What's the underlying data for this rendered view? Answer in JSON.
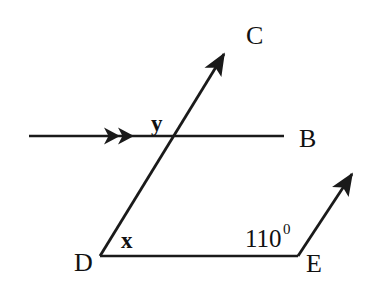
{
  "figure": {
    "type": "geometry-diagram",
    "background_color": "#ffffff",
    "stroke_color": "#1a1a1a",
    "labels": {
      "point_b": "B",
      "point_c": "C",
      "point_d": "D",
      "point_e": "E",
      "angle_x": "x",
      "angle_y": "y",
      "angle_value": "110",
      "angle_value_superscript": "0"
    },
    "elements": [
      {
        "name": "horizontal-line-to-b",
        "kind": "line",
        "from": [
          29,
          136
        ],
        "to": [
          284,
          136
        ],
        "marker": "double-chevron",
        "marker_at": [
          118,
          136
        ],
        "endpoint_label": "B"
      },
      {
        "name": "transversal-ray-d-to-c",
        "kind": "ray",
        "from": [
          100,
          256
        ],
        "to": [
          228,
          48
        ],
        "arrowhead": "end",
        "endpoint_label": "C",
        "passes_through": [
          170,
          136
        ]
      },
      {
        "name": "baseline-d-to-e",
        "kind": "line",
        "from": [
          100,
          256
        ],
        "to": [
          298,
          256
        ],
        "endpoint_label_start": "D",
        "endpoint_label_end": "E"
      },
      {
        "name": "ray-e-upward",
        "kind": "ray",
        "from": [
          298,
          256
        ],
        "to": [
          356,
          168
        ],
        "arrowhead": "end"
      }
    ],
    "annotations": [
      {
        "name": "angle-y",
        "text": "y",
        "at": [
          152,
          130
        ],
        "note": "interior angle at intersection of transversal and line B"
      },
      {
        "name": "angle-x",
        "text": "x",
        "at": [
          122,
          247
        ],
        "note": "angle at vertex D between DE and DC"
      },
      {
        "name": "angle-110",
        "text": "110",
        "superscript": "0",
        "at": [
          245,
          246
        ],
        "note": "angle at vertex E"
      }
    ]
  }
}
